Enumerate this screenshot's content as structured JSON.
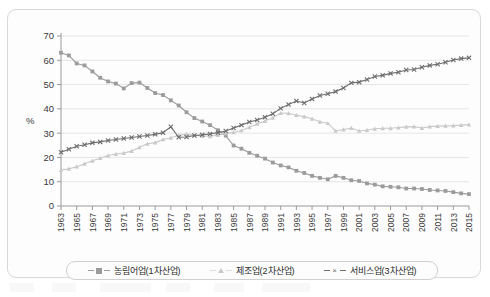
{
  "chart_data": {
    "type": "line",
    "title": "",
    "xlabel": "",
    "ylabel": "%",
    "ylim": [
      0,
      70
    ],
    "ytick_step": 10,
    "yticks": [
      0,
      10,
      20,
      30,
      40,
      50,
      60,
      70
    ],
    "xlim": [
      1963,
      2015
    ],
    "grid": true,
    "legend_position": "bottom",
    "x": [
      1963,
      1964,
      1965,
      1966,
      1967,
      1968,
      1969,
      1970,
      1971,
      1972,
      1973,
      1974,
      1975,
      1976,
      1977,
      1978,
      1979,
      1980,
      1981,
      1982,
      1983,
      1984,
      1985,
      1986,
      1987,
      1988,
      1989,
      1990,
      1991,
      1992,
      1993,
      1994,
      1995,
      1996,
      1997,
      1998,
      1999,
      2000,
      2001,
      2002,
      2003,
      2004,
      2005,
      2006,
      2007,
      2008,
      2009,
      2010,
      2011,
      2012,
      2013,
      2014,
      2015
    ],
    "xtick_labels": [
      "1963",
      "1965",
      "1967",
      "1969",
      "1971",
      "1973",
      "1975",
      "1977",
      "1979",
      "1981",
      "1983",
      "1985",
      "1987",
      "1989",
      "1991",
      "1993",
      "1995",
      "1997",
      "1999",
      "2001",
      "2003",
      "2005",
      "2007",
      "2009",
      "2011",
      "2013",
      "2015"
    ],
    "series": [
      {
        "name": "농림어업(1차산업)",
        "marker": "square",
        "color": "#9b9b9b",
        "values": [
          63.1,
          62.0,
          58.7,
          57.9,
          55.4,
          52.8,
          51.3,
          50.4,
          48.4,
          50.6,
          50.8,
          48.6,
          46.5,
          45.7,
          43.5,
          41.4,
          38.6,
          36.2,
          34.8,
          33.3,
          31.2,
          29.0,
          24.9,
          23.6,
          21.9,
          20.7,
          19.5,
          17.9,
          16.7,
          15.9,
          14.5,
          13.6,
          12.4,
          11.6,
          11.0,
          12.4,
          11.6,
          10.6,
          10.3,
          9.3,
          8.8,
          8.1,
          7.9,
          7.7,
          7.2,
          7.2,
          7.0,
          6.6,
          6.4,
          6.2,
          5.7,
          5.2,
          4.9
        ]
      },
      {
        "name": "제조업(2차산업)",
        "marker": "triangle",
        "color": "#c9c9c9",
        "values": [
          14.8,
          15.3,
          16.2,
          17.4,
          18.6,
          19.7,
          20.8,
          21.4,
          21.8,
          22.6,
          24.2,
          25.6,
          26.1,
          27.4,
          28.1,
          29.1,
          29.6,
          29.1,
          28.8,
          28.7,
          29.2,
          29.9,
          30.3,
          31.1,
          32.4,
          33.8,
          35.0,
          36.3,
          38.3,
          38.2,
          37.4,
          36.8,
          35.9,
          34.7,
          34.1,
          30.9,
          31.5,
          32.1,
          30.9,
          31.3,
          31.8,
          32.0,
          32.0,
          32.3,
          32.6,
          32.7,
          32.1,
          32.7,
          32.9,
          33.0,
          33.1,
          33.3,
          33.5
        ]
      },
      {
        "name": "서비스업(3차산업)",
        "marker": "x",
        "color": "#6e6e6e",
        "values": [
          22.1,
          23.4,
          24.6,
          25.2,
          26.0,
          26.4,
          27.0,
          27.4,
          27.8,
          28.2,
          28.6,
          29.0,
          29.5,
          30.2,
          32.6,
          28.3,
          28.4,
          29.0,
          29.3,
          29.7,
          30.2,
          30.9,
          32.1,
          33.3,
          34.6,
          35.4,
          36.5,
          38.0,
          40.2,
          41.8,
          43.2,
          42.4,
          44.1,
          45.5,
          46.2,
          47.1,
          48.6,
          50.7,
          51.0,
          52.1,
          53.3,
          53.8,
          54.6,
          55.1,
          56.0,
          56.2,
          57.1,
          57.9,
          58.4,
          59.2,
          60.1,
          60.7,
          61.0
        ]
      }
    ]
  },
  "legend": {
    "items": [
      {
        "label": "농림어업(1차산업)",
        "marker": "square"
      },
      {
        "label": "제조업(2차산업)",
        "marker": "triangle"
      },
      {
        "label": "서비스업(3차산업)",
        "marker": "x"
      }
    ]
  },
  "axes": {
    "y_title": "%"
  }
}
